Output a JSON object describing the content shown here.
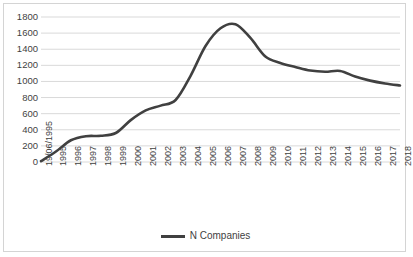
{
  "chart_data": {
    "type": "line",
    "title": "",
    "xlabel": "",
    "ylabel": "",
    "ylim": [
      0,
      1800
    ],
    "ytick_step": 200,
    "yticks": [
      1800,
      1600,
      1400,
      1200,
      1000,
      800,
      600,
      400,
      200,
      0
    ],
    "grid": true,
    "grid_axis": "y",
    "legend_position": "bottom-center",
    "line_color": "#404040",
    "grid_color": "#d9d9d9",
    "border_color": "#d4d4d4",
    "text_color": "#3f3f3f",
    "categories": [
      "19/06/1995",
      "1995",
      "1996",
      "1997",
      "1998",
      "1999",
      "2000",
      "2001",
      "2002",
      "2003",
      "2004",
      "2005",
      "2006",
      "2007",
      "2008",
      "2009",
      "2010",
      "2011",
      "2012",
      "2013",
      "2014",
      "2015",
      "2016",
      "2017",
      "2018"
    ],
    "series": [
      {
        "name": "N Companies",
        "values": [
          10,
          130,
          270,
          320,
          325,
          360,
          520,
          640,
          700,
          770,
          1070,
          1440,
          1660,
          1710,
          1540,
          1310,
          1230,
          1180,
          1135,
          1120,
          1130,
          1060,
          1010,
          975,
          950
        ]
      }
    ]
  },
  "legend": {
    "label": "N Companies"
  }
}
